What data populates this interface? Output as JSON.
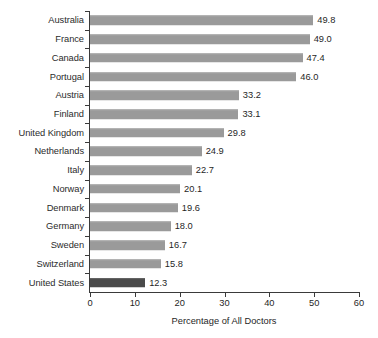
{
  "chart_data": {
    "type": "bar",
    "orientation": "horizontal",
    "title": "",
    "xlabel": "Percentage of All Doctors",
    "ylabel": "",
    "xlim": [
      0,
      60
    ],
    "xticks": [
      0,
      10,
      20,
      30,
      40,
      50,
      60
    ],
    "grid": false,
    "legend": false,
    "bar_color": "#9a9a9a",
    "highlight_color": "#4a4a4a",
    "highlight_category": "United States",
    "categories": [
      "Australia",
      "France",
      "Canada",
      "Portugal",
      "Austria",
      "Finland",
      "United Kingdom",
      "Netherlands",
      "Italy",
      "Norway",
      "Denmark",
      "Germany",
      "Sweden",
      "Switzerland",
      "United States"
    ],
    "values": [
      49.8,
      49.0,
      47.4,
      46.0,
      33.2,
      33.1,
      29.8,
      24.9,
      22.7,
      20.1,
      19.6,
      18.0,
      16.7,
      15.8,
      12.3
    ],
    "value_labels": [
      "49.8",
      "49.0",
      "47.4",
      "46.0",
      "33.2",
      "33.1",
      "29.8",
      "24.9",
      "22.7",
      "20.1",
      "19.6",
      "18.0",
      "16.7",
      "15.8",
      "12.3"
    ]
  }
}
